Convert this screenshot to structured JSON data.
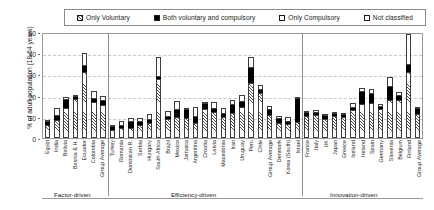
{
  "legend": {
    "items": [
      {
        "key": "voluntary",
        "label": "Only Voluntary",
        "swatch": "hatched-square-icon"
      },
      {
        "key": "both",
        "label": "Both voluntary and compulsory",
        "swatch": "filled-square-icon"
      },
      {
        "key": "compulsory",
        "label": "Only Compulsory",
        "swatch": "dotted-square-icon"
      },
      {
        "key": "notclass",
        "label": "Not classified",
        "swatch": "empty-square-icon"
      }
    ]
  },
  "axes": {
    "ylabel": "% of adult population (18-64 years)",
    "yticks": [
      0,
      10,
      20,
      30,
      40,
      50
    ],
    "ylim": [
      0,
      50
    ],
    "grid": true
  },
  "groups": [
    {
      "name": "Factor-driven",
      "count": 7
    },
    {
      "name": "Efficiency-driven",
      "count": 21
    },
    {
      "name": "Innovation-driven",
      "count": 16
    }
  ],
  "chart_data": {
    "type": "bar",
    "title": "",
    "subtitle": "",
    "xlabel": "",
    "ylabel": "% of adult population (18-64 years)",
    "ylim": [
      0,
      50
    ],
    "yticks": [
      0,
      10,
      20,
      30,
      40,
      50
    ],
    "grid": true,
    "stacked": true,
    "legend_position": "top",
    "series": [
      {
        "name": "Only Voluntary",
        "key": "voluntary"
      },
      {
        "name": "Both voluntary and compulsory",
        "key": "both"
      },
      {
        "name": "Only Compulsory",
        "key": "compulsory"
      },
      {
        "name": "Not classified",
        "key": "notclass"
      }
    ],
    "categories": [
      "Egypt",
      "India",
      "Bolivia",
      "Bosnia & H.",
      "Ecuador",
      "Colombia",
      "Group Average",
      "Turkey",
      "Romania",
      "Dominican R.",
      "Serbia",
      "Hungary",
      "South Africa",
      "Brazil",
      "Mexico",
      "Jamaica",
      "Argentina",
      "Croatia",
      "Latvia",
      "Macedonia",
      "Iran",
      "Uruguay",
      "Peru",
      "Chile",
      "Group Average",
      "Denmark",
      "Korea (South)",
      "Israel",
      "France",
      "Italy",
      "UK",
      "Japan",
      "Greece",
      "Iceland",
      "Ireland",
      "Spain",
      "Germany",
      "Slovenia",
      "Belgium",
      "Finland",
      "Group Average"
    ],
    "values": {
      "voluntary": [
        6.0,
        8.5,
        14.0,
        18.5,
        31.0,
        17.0,
        15.5,
        4.0,
        4.5,
        4.5,
        6.0,
        7.0,
        28.0,
        9.0,
        10.0,
        9.5,
        7.0,
        13.5,
        12.5,
        10.0,
        12.0,
        14.5,
        26.0,
        21.0,
        11.0,
        7.0,
        6.5,
        7.5,
        10.5,
        11.0,
        9.0,
        10.5,
        10.0,
        13.0,
        16.0,
        16.5,
        13.5,
        18.0,
        18.0,
        31.0,
        11.5
      ],
      "both": [
        1.5,
        2.0,
        4.0,
        1.0,
        3.0,
        1.5,
        2.0,
        1.0,
        0.5,
        3.0,
        1.5,
        1.5,
        1.0,
        0.5,
        3.0,
        3.5,
        3.0,
        2.5,
        1.0,
        1.5,
        3.5,
        2.5,
        7.0,
        1.5,
        2.0,
        2.0,
        0.5,
        11.0,
        1.5,
        0.5,
        1.5,
        0.5,
        1.0,
        1.0,
        5.5,
        4.5,
        0.5,
        6.0,
        2.0,
        3.5,
        2.0
      ],
      "compulsory": [
        0.0,
        0.0,
        0.0,
        0.0,
        0.0,
        0.0,
        0.0,
        0.0,
        0.0,
        0.0,
        0.0,
        0.0,
        0.0,
        0.0,
        0.0,
        0.0,
        0.0,
        0.0,
        0.0,
        0.0,
        0.0,
        0.0,
        0.0,
        0.0,
        0.0,
        0.0,
        0.0,
        0.0,
        0.0,
        0.0,
        0.0,
        0.0,
        0.0,
        0.0,
        0.0,
        0.0,
        0.0,
        0.0,
        0.0,
        0.0,
        0.0
      ],
      "notclass": [
        1.0,
        3.5,
        1.5,
        1.0,
        6.0,
        3.5,
        2.5,
        0.5,
        2.5,
        2.0,
        2.0,
        3.0,
        9.0,
        3.0,
        4.5,
        1.0,
        4.5,
        1.0,
        3.5,
        2.5,
        2.5,
        3.5,
        5.0,
        2.5,
        2.0,
        1.5,
        2.5,
        1.0,
        0.5,
        1.5,
        1.0,
        0.5,
        0.5,
        2.5,
        2.0,
        2.0,
        1.5,
        5.0,
        1.5,
        14.5,
        1.0
      ]
    },
    "totals": [
      8.5,
      14.0,
      19.5,
      20.5,
      40.0,
      22.0,
      20.0,
      5.5,
      7.5,
      9.5,
      9.5,
      11.5,
      38.0,
      12.5,
      17.5,
      14.0,
      14.5,
      17.0,
      17.0,
      14.0,
      18.0,
      20.5,
      38.0,
      25.0,
      15.0,
      10.5,
      9.5,
      19.5,
      12.5,
      13.0,
      11.5,
      11.5,
      11.5,
      16.5,
      23.5,
      23.0,
      15.5,
      29.0,
      21.5,
      49.0,
      14.5
    ]
  }
}
